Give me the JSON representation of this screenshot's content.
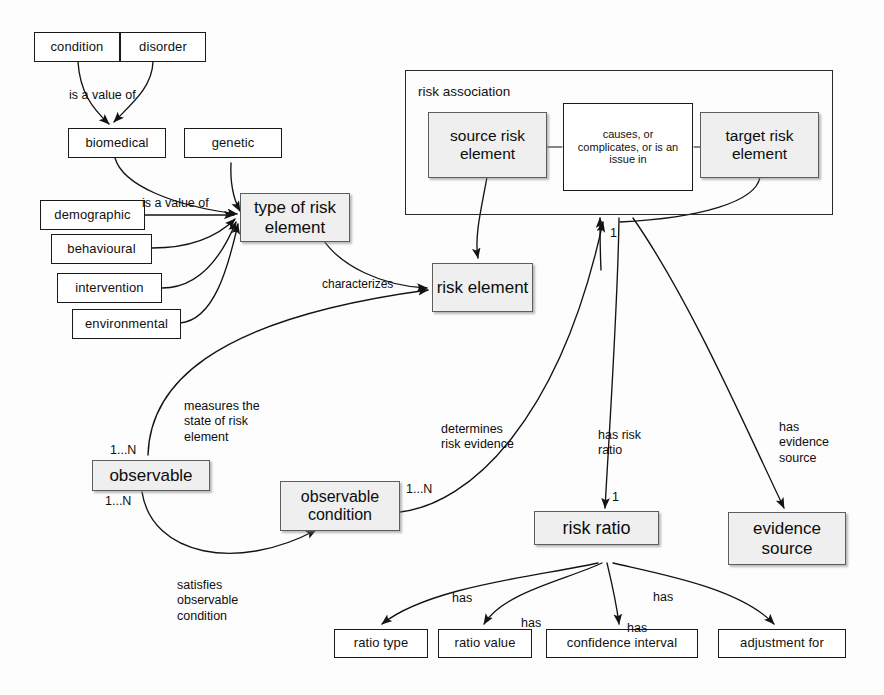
{
  "diagram": {
    "colors": {
      "entity_fill": "#efefef",
      "entity_border": "#5d5d5d",
      "plain_fill": "#ffffff",
      "line": "#1a1a1a",
      "background": "#fdfdfd"
    }
  },
  "nodes": {
    "condition": "condition",
    "disorder": "disorder",
    "biomedical": "biomedical",
    "genetic": "genetic",
    "demographic": "demographic",
    "behavioural": "behavioural",
    "intervention": "intervention",
    "environmental": "environmental",
    "type_of_risk_element": "type of risk element",
    "risk_element": "risk element",
    "source_risk_element": "source risk element",
    "target_risk_element": "target risk element",
    "relationship_diamond": "causes, or complicates, or is an issue in",
    "risk_association": "risk association",
    "observable": "observable",
    "observable_condition": "observable condition",
    "risk_ratio": "risk ratio",
    "evidence_source": "evidence source",
    "ratio_type": "ratio type",
    "ratio_value": "ratio value",
    "confidence_interval": "confidence interval",
    "adjustment_for": "adjustment for"
  },
  "edge_labels": {
    "is_a_value_of_1": "is a value of",
    "is_a_value_of_2": "is a value of",
    "characterizes": "characterizes",
    "measures_state": "measures the\nstate of risk\nelement",
    "satisfies": "satisfies\nobservable\ncondition",
    "determines": "determines\nrisk evidence",
    "has_risk_ratio": "has risk\nratio",
    "has_evidence_source": "has\nevidence\nsource",
    "has_ratio_type": "has",
    "has_ratio_value": "has",
    "has_confidence_interval": "has",
    "has_adjustment_for": "has"
  },
  "cardinalities": {
    "observable_top": "1...N",
    "observable_bottom": "1...N",
    "observable_condition_right": "1...N",
    "risk_element_up": "1",
    "risk_ratio_in": "1"
  }
}
